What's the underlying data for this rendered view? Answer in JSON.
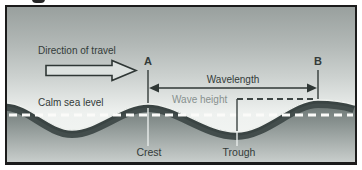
{
  "figure": {
    "labels": {
      "direction_of_travel": "Direction of travel",
      "point_a": "A",
      "point_b": "B",
      "wavelength": "Wavelength",
      "wave_height": "Wave height",
      "calm_sea_level": "Calm sea level",
      "crest": "Crest",
      "trough": "Trough"
    },
    "colors": {
      "border": "#1b1b1b",
      "sky_top": "#99a09e",
      "sky_bottom": "#f6f8f6",
      "water_surface_dark": "#3e4847",
      "water_bottom_light": "#cacfcd",
      "sea_level_dash": "#fbfbf9",
      "annotation_dark": "#333b39",
      "annotation_muted": "#87908e"
    }
  }
}
